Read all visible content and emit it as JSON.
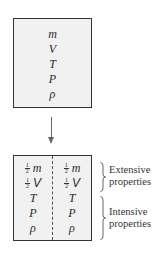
{
  "diagram": {
    "whole_system": {
      "properties": [
        "m",
        "V",
        "T",
        "P",
        "ρ"
      ]
    },
    "arrow": {
      "direction": "down"
    },
    "divided_system": {
      "left_half": [
        {
          "fraction": {
            "num": "1",
            "den": "2"
          },
          "symbol": "m"
        },
        {
          "fraction": {
            "num": "1",
            "den": "2"
          },
          "symbol": "V"
        },
        {
          "symbol": "T"
        },
        {
          "symbol": "P"
        },
        {
          "symbol": "ρ"
        }
      ],
      "right_half": [
        {
          "fraction": {
            "num": "1",
            "den": "2"
          },
          "symbol": "m"
        },
        {
          "fraction": {
            "num": "1",
            "den": "2"
          },
          "symbol": "V"
        },
        {
          "symbol": "T"
        },
        {
          "symbol": "P"
        },
        {
          "symbol": "ρ"
        }
      ],
      "divider_style": "dashed"
    },
    "labels": {
      "extensive": [
        "Extensive",
        "properties"
      ],
      "intensive": [
        "Intensive",
        "properties"
      ]
    }
  }
}
